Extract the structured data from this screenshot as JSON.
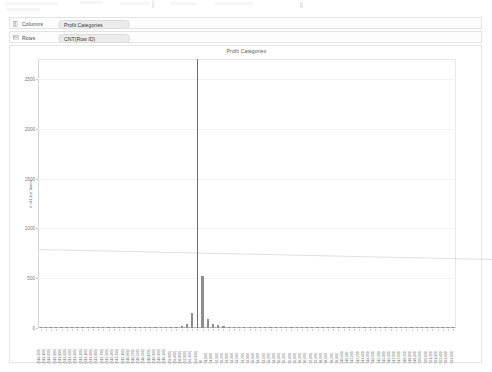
{
  "shelves": {
    "columns": {
      "label": "Columns",
      "icon": "columns-grid-icon",
      "pill": "Profit Categories"
    },
    "rows": {
      "label": "Rows",
      "icon": "rows-grid-icon",
      "pill": "CNT(Row ID)"
    }
  },
  "chart_data": {
    "type": "bar",
    "title": "Profit Categories",
    "xlabel": "",
    "ylabel": "# of Line Items",
    "ylim": [
      0,
      2700
    ],
    "yticks": [
      0,
      500,
      1000,
      1500,
      2000,
      2500
    ],
    "ytick_labels": [
      "0",
      "500",
      "1000",
      "1500",
      "2000",
      "2500"
    ],
    "grid": true,
    "legend": "none",
    "annotations": [
      {
        "name": "reference-line",
        "y_start": 790,
        "y_end": 690,
        "style": "thin-grey-sloped"
      }
    ],
    "categories": [
      "($14,200)",
      "($14,100)",
      "($14,000)",
      "($13,900)",
      "($13,800)",
      "($13,600)",
      "($13,500)",
      "($13,400)",
      "($13,300)",
      "($13,100)",
      "($13,000)",
      "($12,800)",
      "($12,700)",
      "($12,500)",
      "($12,400)",
      "($12,200)",
      "($12,100)",
      "($11,900)",
      "($11,700)",
      "($11,500)",
      "($11,300)",
      "($11,100)",
      "($10,900)",
      "($10,600)",
      "($10,300)",
      "($9,900)",
      "($9,400)",
      "($8,800)",
      "($7,900)",
      "($6,300)",
      "($3,300)",
      "$0",
      "$1,100",
      "$1,800",
      "$2,300",
      "$2,700",
      "$3,000",
      "$3,300",
      "$3,500",
      "$3,700",
      "$3,900",
      "$4,100",
      "$4,300",
      "$4,500",
      "$4,700",
      "$4,900",
      "$5,100",
      "$5,300",
      "$5,600",
      "$5,900",
      "$6,200",
      "$6,600",
      "$7,000",
      "$7,500",
      "$8,000",
      "$8,600",
      "$9,200",
      "$9,900",
      "$10,600",
      "$11,300",
      "$12,000",
      "$12,700",
      "$13,400",
      "$14,000",
      "$14,600",
      "$15,200",
      "$15,800",
      "$16,400",
      "$17,000",
      "$17,600",
      "$18,200",
      "$18,800",
      "$19,400",
      "$20,000",
      "$20,600",
      "$21,200",
      "$21,800",
      "$22,400",
      "$23,000",
      "$23,600"
    ],
    "values": [
      2,
      2,
      2,
      3,
      2,
      2,
      3,
      2,
      2,
      3,
      2,
      2,
      3,
      2,
      3,
      2,
      3,
      3,
      3,
      3,
      4,
      4,
      4,
      5,
      6,
      8,
      12,
      20,
      45,
      150,
      2700,
      520,
      95,
      42,
      26,
      18,
      14,
      12,
      10,
      9,
      8,
      8,
      7,
      7,
      6,
      6,
      6,
      5,
      5,
      5,
      5,
      4,
      4,
      4,
      4,
      4,
      3,
      3,
      3,
      3,
      3,
      3,
      3,
      3,
      2,
      2,
      2,
      2,
      2,
      2,
      2,
      2,
      2,
      2,
      2,
      2,
      2,
      2,
      2,
      2
    ]
  }
}
